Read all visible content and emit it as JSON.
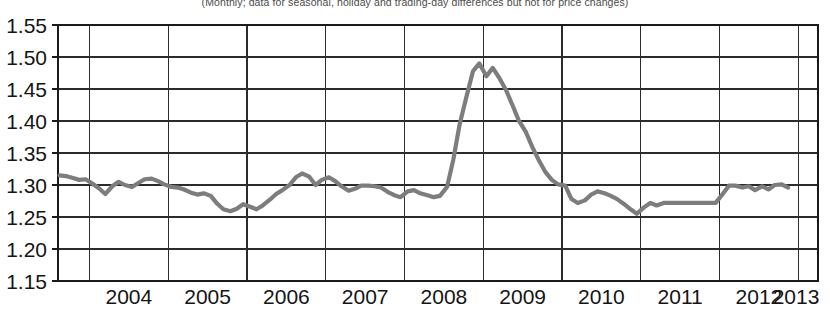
{
  "chart_data": {
    "type": "line",
    "title": "",
    "subtitle": "(Monthly; data for seasonal, holiday and trading-day differences but not for price changes)",
    "xlabel": "",
    "ylabel": "",
    "grid": true,
    "legend": "none",
    "xlim": [
      2003.6,
      2013.25
    ],
    "ylim": [
      1.15,
      1.55
    ],
    "ytick_labels": [
      "1.55",
      "1.50",
      "1.45",
      "1.40",
      "1.35",
      "1.30",
      "1.25",
      "1.20",
      "1.15"
    ],
    "ytick_values": [
      1.55,
      1.5,
      1.45,
      1.4,
      1.35,
      1.3,
      1.25,
      1.2,
      1.15
    ],
    "xtick_labels": [
      "2004",
      "2005",
      "2006",
      "2007",
      "2008",
      "2009",
      "2010",
      "2011",
      "2012",
      "2013"
    ],
    "xtick_values": [
      2004,
      2005,
      2006,
      2007,
      2008,
      2009,
      2010,
      2011,
      2012,
      2013
    ],
    "series": [
      {
        "name": "inventories-to-sales ratio",
        "color": "#7d7d7d",
        "x": [
          2003.62,
          2003.7,
          2003.79,
          2003.87,
          2003.95,
          2004.04,
          2004.12,
          2004.2,
          2004.29,
          2004.37,
          2004.45,
          2004.54,
          2004.62,
          2004.7,
          2004.79,
          2004.87,
          2004.95,
          2005.04,
          2005.12,
          2005.2,
          2005.29,
          2005.37,
          2005.45,
          2005.54,
          2005.62,
          2005.7,
          2005.79,
          2005.87,
          2005.95,
          2006.04,
          2006.12,
          2006.2,
          2006.29,
          2006.37,
          2006.45,
          2006.54,
          2006.62,
          2006.7,
          2006.79,
          2006.87,
          2006.95,
          2007.04,
          2007.12,
          2007.2,
          2007.29,
          2007.37,
          2007.45,
          2007.54,
          2007.62,
          2007.7,
          2007.79,
          2007.87,
          2007.95,
          2008.04,
          2008.12,
          2008.2,
          2008.29,
          2008.37,
          2008.45,
          2008.54,
          2008.62,
          2008.7,
          2008.79,
          2008.87,
          2008.95,
          2009.04,
          2009.12,
          2009.2,
          2009.29,
          2009.37,
          2009.45,
          2009.54,
          2009.62,
          2009.7,
          2009.79,
          2009.87,
          2009.95,
          2010.04,
          2010.12,
          2010.2,
          2010.29,
          2010.37,
          2010.45,
          2010.54,
          2010.62,
          2010.7,
          2010.79,
          2010.87,
          2010.95,
          2011.04,
          2011.12,
          2011.2,
          2011.29,
          2011.37,
          2011.45,
          2011.54,
          2011.62,
          2011.7,
          2011.79,
          2011.87,
          2011.95,
          2012.04,
          2012.12,
          2012.2,
          2012.29,
          2012.37,
          2012.45,
          2012.54,
          2012.62,
          2012.7,
          2012.79,
          2012.87
        ],
        "y": [
          1.315,
          1.314,
          1.311,
          1.308,
          1.309,
          1.302,
          1.295,
          1.286,
          1.298,
          1.305,
          1.3,
          1.297,
          1.303,
          1.309,
          1.31,
          1.306,
          1.301,
          1.297,
          1.296,
          1.293,
          1.288,
          1.285,
          1.287,
          1.283,
          1.271,
          1.262,
          1.259,
          1.263,
          1.27,
          1.266,
          1.262,
          1.268,
          1.277,
          1.286,
          1.292,
          1.3,
          1.312,
          1.318,
          1.313,
          1.3,
          1.308,
          1.312,
          1.306,
          1.298,
          1.291,
          1.294,
          1.299,
          1.299,
          1.298,
          1.296,
          1.289,
          1.284,
          1.281,
          1.29,
          1.292,
          1.287,
          1.284,
          1.281,
          1.283,
          1.297,
          1.34,
          1.395,
          1.44,
          1.478,
          1.49,
          1.47,
          1.483,
          1.468,
          1.448,
          1.425,
          1.401,
          1.383,
          1.36,
          1.34,
          1.32,
          1.308,
          1.301,
          1.299,
          1.278,
          1.272,
          1.276,
          1.285,
          1.29,
          1.287,
          1.283,
          1.278,
          1.27,
          1.262,
          1.255,
          1.265,
          1.272,
          1.268,
          1.272,
          1.272,
          1.272,
          1.272,
          1.272,
          1.272,
          1.272,
          1.272,
          1.272,
          1.286,
          1.299,
          1.299,
          1.296,
          1.298,
          1.292,
          1.298,
          1.293,
          1.3,
          1.301,
          1.296
        ]
      }
    ]
  },
  "axes": {
    "y_tick_label_name": "y-axis-tick-label",
    "x_tick_label_name": "x-axis-tick-label"
  }
}
